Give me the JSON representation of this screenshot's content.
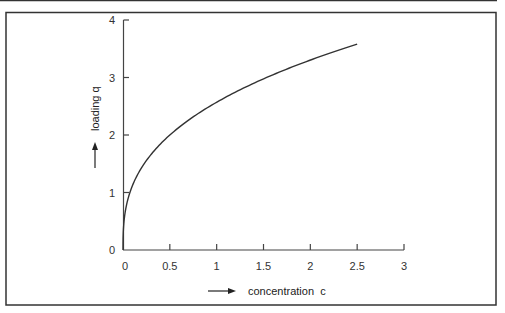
{
  "chart_data": {
    "type": "line",
    "title": "",
    "xlabel": "concentration  c",
    "ylabel": "loading q",
    "xlim": [
      0,
      3
    ],
    "ylim": [
      0,
      4
    ],
    "xticks": [
      "0",
      "0.5",
      "1",
      "1.5",
      "2",
      "2.5",
      "3"
    ],
    "yticks": [
      "0",
      "1",
      "2",
      "3",
      "4"
    ],
    "grid": false,
    "legend": null,
    "series": [
      {
        "name": "loading isotherm",
        "x": [
          0,
          0.02,
          0.05,
          0.1,
          0.2,
          0.3,
          0.4,
          0.5,
          0.75,
          1.0,
          1.25,
          1.5,
          1.75,
          2.0,
          2.25,
          2.5
        ],
        "y": [
          0,
          0.63,
          0.87,
          1.11,
          1.44,
          1.66,
          1.85,
          2.0,
          2.31,
          2.57,
          2.79,
          2.98,
          3.16,
          3.32,
          3.46,
          3.58
        ]
      }
    ]
  },
  "labels": {
    "xlabel": "concentration  c",
    "ylabel": "loading q"
  },
  "colors": {
    "line": "#333333",
    "axis": "#444444",
    "frame": "#333333"
  }
}
